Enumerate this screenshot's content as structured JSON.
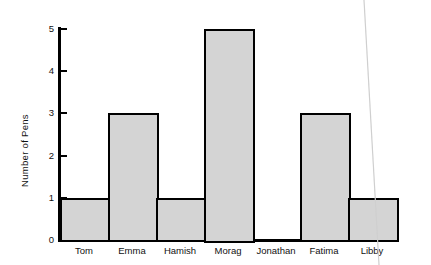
{
  "chart_data": {
    "type": "bar",
    "title": "",
    "subtitle": "",
    "xlabel": "",
    "ylabel": "Number of Pens",
    "categories": [
      "Tom",
      "Emma",
      "Hamish",
      "Morag",
      "Jonathan",
      "Fatima",
      "Libby"
    ],
    "values": [
      1,
      3,
      1,
      5,
      0,
      3,
      1
    ],
    "series": [
      {
        "name": "Number of Pens",
        "values": [
          1,
          3,
          1,
          5,
          0,
          3,
          1
        ]
      }
    ],
    "ylim": [
      0,
      5
    ],
    "ytick_labels": [
      "0",
      "1",
      "2",
      "3",
      "4",
      "5"
    ],
    "ytick_values": [
      0,
      1,
      2,
      3,
      4,
      5
    ],
    "grid": false,
    "legend": "none",
    "bar_style": "adjacent",
    "colors": {
      "bar_fill": "#d4d4d4",
      "bar_edge": "#000000",
      "axis": "#000000",
      "text": "#111111",
      "background": "#ffffff",
      "artifact_line": "#cfcfcf"
    }
  },
  "axis": {
    "y_label": "Number of Pens",
    "ticks": [
      {
        "label": "5",
        "value": 5
      },
      {
        "label": "4",
        "value": 4
      },
      {
        "label": "3",
        "value": 3
      },
      {
        "label": "2",
        "value": 2
      },
      {
        "label": "1",
        "value": 1
      },
      {
        "label": "0",
        "value": 0
      }
    ]
  }
}
